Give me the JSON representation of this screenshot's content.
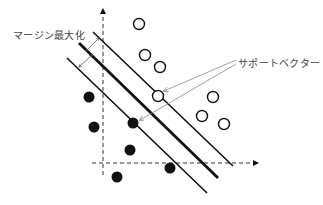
{
  "diagram": {
    "type": "svm-margin-diagram",
    "labels": {
      "margin": "マージン最大化",
      "support_vectors": "サポートベクター"
    },
    "axes": {
      "x_axis": {
        "x1": 92,
        "y1": 163,
        "x2": 258,
        "y2": 163
      },
      "y_axis": {
        "x1": 103,
        "y1": 175,
        "x2": 103,
        "y2": 9
      }
    },
    "lines": [
      {
        "name": "upper-margin",
        "x1": 93,
        "y1": 32,
        "x2": 233,
        "y2": 166,
        "width": 1.6
      },
      {
        "name": "decision-boundary",
        "x1": 79,
        "y1": 43,
        "x2": 218,
        "y2": 178,
        "width": 2.8
      },
      {
        "name": "lower-margin",
        "x1": 67,
        "y1": 58,
        "x2": 207,
        "y2": 193,
        "width": 1.6
      }
    ],
    "open_circles": [
      {
        "cx": 139,
        "cy": 24
      },
      {
        "cx": 145,
        "cy": 55
      },
      {
        "cx": 160,
        "cy": 67
      },
      {
        "cx": 158,
        "cy": 96
      },
      {
        "cx": 213,
        "cy": 97
      },
      {
        "cx": 202,
        "cy": 116
      },
      {
        "cx": 224,
        "cy": 124
      }
    ],
    "filled_circles": [
      {
        "cx": 89,
        "cy": 97
      },
      {
        "cx": 94,
        "cy": 127
      },
      {
        "cx": 133,
        "cy": 123
      },
      {
        "cx": 130,
        "cy": 150
      },
      {
        "cx": 170,
        "cy": 168
      },
      {
        "cx": 117,
        "cy": 177
      }
    ],
    "colors": {
      "stroke": "#111111",
      "pointer": "#888888",
      "text": "#444444"
    }
  }
}
